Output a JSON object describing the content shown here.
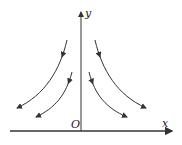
{
  "diagram": {
    "axes": {
      "x_label": "x",
      "y_label": "y",
      "origin_label": "O"
    },
    "curves": [
      {
        "name": "left-outer",
        "d": "M67,40 C60,70 45,95 17,108"
      },
      {
        "name": "left-inner",
        "d": "M72,72 C66,95 55,108 36,117"
      },
      {
        "name": "right-outer",
        "d": "M95,40 C102,70 117,95 146,108"
      },
      {
        "name": "right-inner",
        "d": "M89,72 C95,95 106,108 127,117"
      }
    ],
    "stroke_color": "#333333"
  }
}
